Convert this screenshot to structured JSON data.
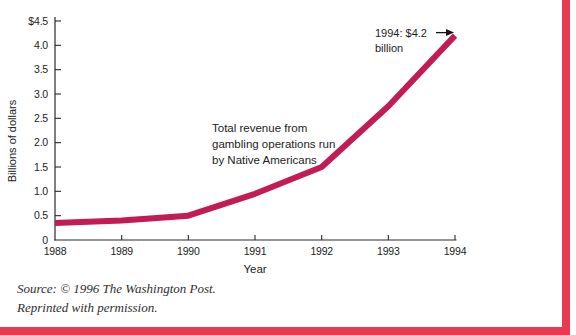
{
  "figure": {
    "accent_border_color": "#e93a51",
    "source_line1": "Source: © 1996 The Washington Post.",
    "source_line2": "Reprinted with permission."
  },
  "chart_data": {
    "type": "line",
    "title": "",
    "x": [
      1988,
      1989,
      1990,
      1991,
      1992,
      1993,
      1994
    ],
    "values": [
      0.35,
      0.4,
      0.5,
      0.95,
      1.5,
      2.75,
      4.2
    ],
    "series_name": "Total revenue from gambling operations run by Native Americans",
    "series_label_lines": [
      "Total revenue from",
      "gambling operations run",
      "by Native Americans"
    ],
    "xlabel": "Year",
    "ylabel": "Billions of dollars",
    "xlim": [
      1988,
      1994
    ],
    "ylim": [
      0,
      4.5
    ],
    "xtick_labels": [
      "1988",
      "1989",
      "1990",
      "1991",
      "1992",
      "1993",
      "1994"
    ],
    "ytick_values": [
      0,
      0.5,
      1,
      1.5,
      2,
      2.5,
      3,
      3.5,
      4,
      4.5
    ],
    "ytick_labels": [
      "0",
      "0.5",
      "1.0",
      "1.5",
      "2.0",
      "2.5",
      "3.0",
      "3.5",
      "4.0",
      "$4.5"
    ],
    "grid": false,
    "legend_position": "none",
    "line_color": "#c31b53",
    "axis_color": "#2b2b2b",
    "arrow_color": "#151515",
    "annotation": {
      "text_line1": "1994: $4.2",
      "text_line2": "billion",
      "arrow_to": {
        "x": 1994,
        "y": 4.2
      }
    }
  }
}
